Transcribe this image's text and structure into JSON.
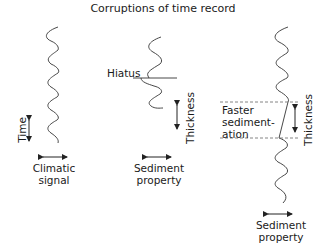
{
  "title": "Corruptions of time record",
  "panels": [
    {
      "id": "climatic",
      "vertical_label": "Time",
      "bottom_label_line1": "Climatic",
      "bottom_label_line2": "signal"
    },
    {
      "id": "hiatus",
      "annotation": "Hiatus",
      "vertical_label": "Thickness",
      "bottom_label_line1": "Sediment",
      "bottom_label_line2": "property"
    },
    {
      "id": "faster",
      "annotation_line1": "Faster",
      "annotation_line2": "sediment-",
      "annotation_line3": "ation",
      "vertical_label": "Thickness",
      "bottom_label_line1": "Sediment",
      "bottom_label_line2": "property"
    }
  ],
  "colors": {
    "stroke": "#333333",
    "dashed": "#777777",
    "text": "#1a1a1a"
  }
}
